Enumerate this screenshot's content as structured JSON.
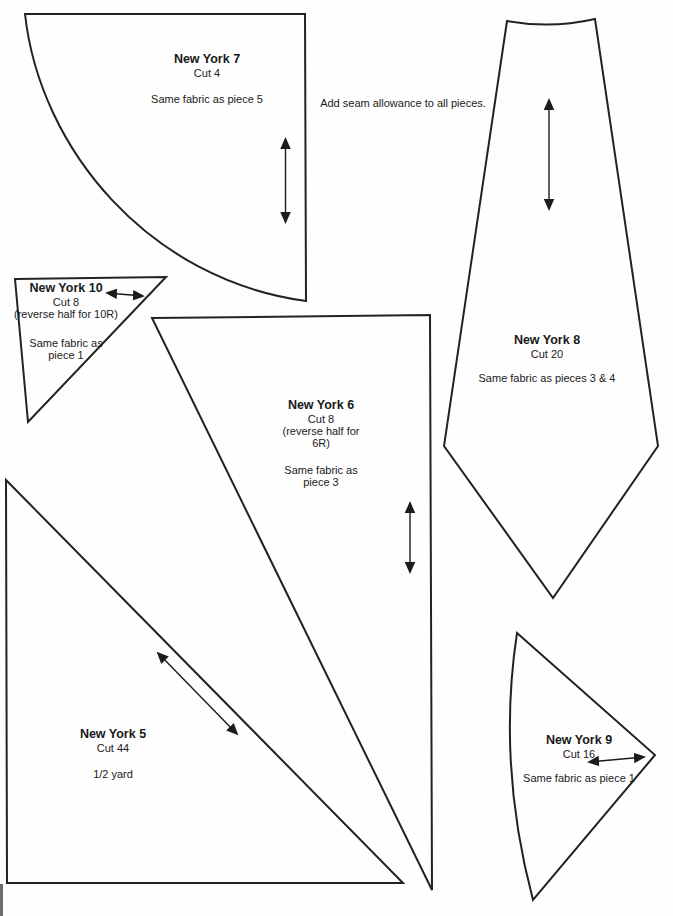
{
  "note": "Add seam allowance to all pieces.",
  "pieces": {
    "ny7": {
      "title": "New York 7",
      "cut": "Cut 4",
      "fabric": "Same fabric as piece 5"
    },
    "ny10": {
      "title": "New York 10",
      "cut": "Cut 8",
      "reverse": "(reverse half for 10R)",
      "fabric_line1": "Same fabric as",
      "fabric_line2": "piece 1"
    },
    "ny6": {
      "title": "New York 6",
      "cut": "Cut 8",
      "reverse_line1": "(reverse half for",
      "reverse_line2": "6R)",
      "fabric_line1": "Same fabric as",
      "fabric_line2": "piece 3"
    },
    "ny5": {
      "title": "New York 5",
      "cut": "Cut 44",
      "yardage": "1/2 yard"
    },
    "ny8": {
      "title": "New York 8",
      "cut": "Cut 20",
      "fabric": "Same fabric as pieces 3 & 4"
    },
    "ny9": {
      "title": "New York 9",
      "cut": "Cut 16",
      "fabric": "Same fabric as piece 1"
    }
  },
  "colors": {
    "ink": "#1c1c1c",
    "paper": "#ffffff"
  }
}
